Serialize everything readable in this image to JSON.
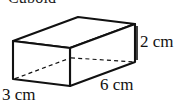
{
  "figure": {
    "title": "Cuboid",
    "shape_name": "cuboid",
    "background_color": "#ffffff",
    "line_color": "#111111",
    "hidden_edge_style": "dashed",
    "projection": "oblique",
    "labels": {
      "height": "2 cm",
      "length": "6 cm",
      "width": "3 cm"
    },
    "dimensions": {
      "height_value": 2,
      "length_value": 6,
      "width_value": 3,
      "unit": "cm"
    },
    "geometry": {
      "front_top_left": [
        13,
        41
      ],
      "front_top_right": [
        70,
        48
      ],
      "front_bottom_left": [
        13,
        79
      ],
      "front_bottom_right": [
        70,
        86
      ],
      "back_top_left": [
        78,
        17
      ],
      "back_top_right": [
        135,
        24
      ],
      "back_bottom_left": [
        78,
        55
      ],
      "back_bottom_right": [
        135,
        62
      ],
      "visible_edges": [
        [
          13,
          41,
          70,
          48
        ],
        [
          13,
          41,
          78,
          17
        ],
        [
          78,
          17,
          135,
          24
        ],
        [
          70,
          48,
          135,
          24
        ],
        [
          13,
          41,
          13,
          79
        ],
        [
          70,
          48,
          70,
          86
        ],
        [
          135,
          24,
          135,
          62
        ],
        [
          13,
          79,
          70,
          86
        ],
        [
          70,
          86,
          135,
          62
        ]
      ],
      "hidden_edges": [
        [
          78,
          17,
          78,
          55
        ],
        [
          13,
          79,
          78,
          55
        ],
        [
          78,
          55,
          135,
          62
        ]
      ]
    }
  }
}
